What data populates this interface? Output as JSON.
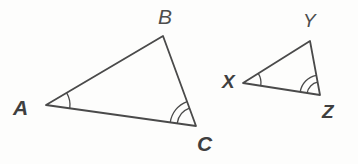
{
  "figure": {
    "background_color": "#fdfdfc",
    "stroke_color": "#4a4a4a",
    "label_color": "#3f3f3f",
    "stroke_width": 1.8,
    "arc_stroke_width": 1.3
  },
  "triangles": [
    {
      "name": "triangle-abc",
      "vertices": [
        {
          "id": "A",
          "label": "A",
          "x": 46,
          "y": 105,
          "label_x": 13,
          "label_y": 97,
          "weight": "bold",
          "arcs": 1
        },
        {
          "id": "B",
          "label": "B",
          "x": 163,
          "y": 36,
          "label_x": 158,
          "label_y": 6,
          "weight": "regular",
          "arcs": 0
        },
        {
          "id": "C",
          "label": "C",
          "x": 196,
          "y": 126,
          "label_x": 197,
          "label_y": 133,
          "weight": "bold",
          "arcs": 2
        }
      ]
    },
    {
      "name": "triangle-xyz",
      "vertices": [
        {
          "id": "X",
          "label": "X",
          "x": 243,
          "y": 83,
          "label_x": 222,
          "label_y": 72,
          "weight": "bold",
          "arcs": 1
        },
        {
          "id": "Y",
          "label": "Y",
          "x": 310,
          "y": 41,
          "label_x": 303,
          "label_y": 11,
          "weight": "regular",
          "arcs": 0
        },
        {
          "id": "Z",
          "label": "Z",
          "x": 320,
          "y": 95,
          "label_x": 322,
          "label_y": 102,
          "weight": "bold",
          "arcs": 2
        }
      ]
    }
  ],
  "angle_marks": [
    {
      "name": "angle-arc-a",
      "vertex": "A",
      "arcs": 1,
      "radius": 24
    },
    {
      "name": "angle-arc-c",
      "vertex": "C",
      "arcs": 2,
      "radius": 26
    },
    {
      "name": "angle-arc-x",
      "vertex": "X",
      "arcs": 1,
      "radius": 18
    },
    {
      "name": "angle-arc-z",
      "vertex": "Z",
      "arcs": 2,
      "radius": 20
    }
  ]
}
